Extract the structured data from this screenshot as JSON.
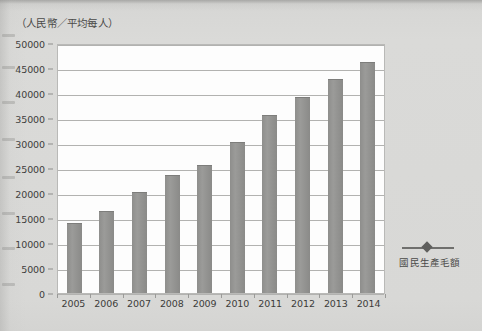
{
  "axis_caption": "（人民幣／平均每人）",
  "legend": {
    "marker_icon": "line-diamond-marker-icon",
    "label": "國民生產毛額"
  },
  "chart_data": {
    "type": "bar",
    "title": "",
    "subtitle": "",
    "xlabel": "",
    "ylabel": "（人民幣／平均每人）",
    "categories": [
      "2005",
      "2006",
      "2007",
      "2008",
      "2009",
      "2010",
      "2011",
      "2012",
      "2013",
      "2014"
    ],
    "series": [
      {
        "name": "國民生產毛額",
        "values": [
          14100,
          16500,
          20200,
          23700,
          25600,
          30200,
          35700,
          39300,
          42900,
          46200
        ]
      }
    ],
    "ylim": [
      0,
      50000
    ],
    "ytick_step": 5000,
    "ytick_labels": [
      "0",
      "5000",
      "10000",
      "15000",
      "20000",
      "25000",
      "30000",
      "35000",
      "40000",
      "45000",
      "50000"
    ],
    "grid": true,
    "legend_position": "right",
    "bar_color": "#939391",
    "plot_background": "#fdfdfd",
    "page_background": "#d9d9d7"
  }
}
